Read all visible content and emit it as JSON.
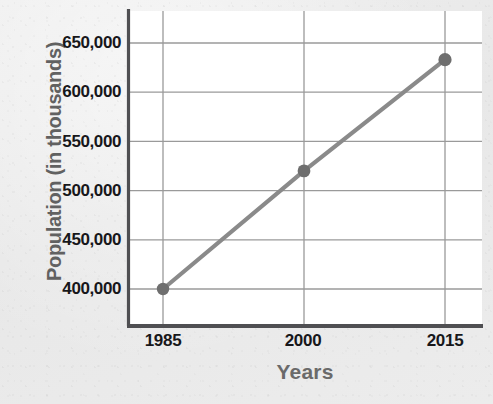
{
  "chart_data": {
    "type": "line",
    "title": "",
    "xlabel": "Years",
    "ylabel": "Population (in thousands)",
    "x": [
      1985,
      2000,
      2015
    ],
    "values": [
      400000,
      520000,
      633000
    ],
    "categories": [
      "1985",
      "2000",
      "2015"
    ],
    "xtick_labels": [
      "1985",
      "2000",
      "2015"
    ],
    "ytick_labels": [
      "400,000",
      "450,000",
      "500,000",
      "550,000",
      "600,000",
      "650,000"
    ],
    "ytick_values": [
      400000,
      450000,
      500000,
      550000,
      600000,
      650000
    ],
    "ylim": [
      375000,
      662000
    ],
    "xlim": [
      1981.5,
      2019.5
    ],
    "grid": true,
    "legend": false,
    "series": [
      {
        "name": "Population",
        "values": [
          400000,
          520000,
          633000
        ]
      }
    ],
    "colors": {
      "line": "#8a8a8a",
      "marker": "#6e6e6e",
      "grid": "#9a9a9a",
      "axis": "#4f4f52",
      "tick_label": "#17171a",
      "axis_title": "#656565",
      "plot_background": "#ffffff",
      "figure_background": "#ebebeb"
    }
  }
}
